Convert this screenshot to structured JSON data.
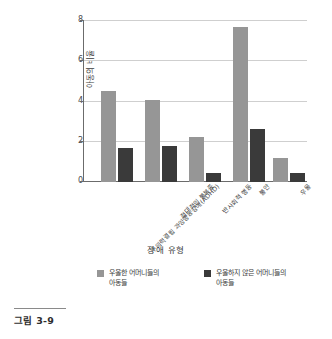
{
  "chart_data": {
    "type": "bar",
    "title": "",
    "xlabel": "장애 유형",
    "ylabel": "아동의 비율",
    "ylim": [
      0,
      8
    ],
    "yticks": [
      0,
      2,
      4,
      6,
      8
    ],
    "ytick_labels": [
      "0",
      "2",
      "4",
      "6",
      "8"
    ],
    "grid": true,
    "legend_position": "bottom",
    "categories": [
      "주의력결핍 과잉행동장애(ADHD)",
      "적대적인 불복종",
      "반사회적 행동",
      "불안",
      "우울"
    ],
    "series": [
      {
        "name": "우울한 어머니들의\n아동들",
        "color": "#969696",
        "values": [
          4.5,
          4.05,
          2.2,
          7.65,
          1.2
        ]
      },
      {
        "name": "우울하지 않은 어머니들의\n아동들",
        "color": "#3a3a3a",
        "values": [
          1.7,
          1.8,
          0.45,
          2.6,
          0.45
        ]
      }
    ]
  },
  "caption": {
    "label": "그림 3-9"
  },
  "colors": {
    "series_light": "#969696",
    "series_dark": "#3a3a3a",
    "gridline": "#cfcfcf",
    "axis": "#6b6b6b",
    "text": "#3c3c3c"
  }
}
